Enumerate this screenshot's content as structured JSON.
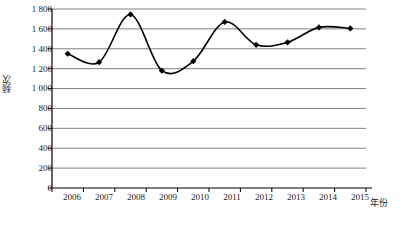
{
  "chart_data": {
    "type": "line",
    "title": "",
    "xlabel": "年份",
    "ylabel": "频次",
    "categories": [
      "2006",
      "2007",
      "2008",
      "2009",
      "2010",
      "2011",
      "2012",
      "2013",
      "2014",
      "2015"
    ],
    "x": [
      2006,
      2007,
      2008,
      2009,
      2010,
      2011,
      2012,
      2013,
      2014,
      2015
    ],
    "values": [
      1350,
      1265,
      1745,
      1180,
      1275,
      1670,
      1440,
      1465,
      1615,
      1605
    ],
    "series": [
      {
        "name": "频次",
        "values": [
          1350,
          1265,
          1745,
          1180,
          1275,
          1670,
          1440,
          1465,
          1615,
          1605
        ]
      }
    ],
    "ylim": [
      0,
      1800
    ],
    "ytick_step": 200,
    "ytick_labels": [
      "1 800",
      "1 600",
      "1 400",
      "1 200",
      "1 000",
      "800",
      "600",
      "400",
      "200",
      "0"
    ],
    "ytick_values": [
      1800,
      1600,
      1400,
      1200,
      1000,
      800,
      600,
      400,
      200,
      0
    ],
    "xtick_labels": [
      "2006",
      "2007",
      "2008",
      "2009",
      "2010",
      "2011",
      "2012",
      "2013",
      "2014",
      "2015"
    ],
    "grid": "horizontal",
    "legend": "none",
    "line_color": "#000000",
    "marker": "diamond",
    "marker_color": "#000000",
    "smoothing": "spline",
    "plot_background": "#ffffff",
    "grid_color": "#808080",
    "axis_color": "#000000"
  }
}
